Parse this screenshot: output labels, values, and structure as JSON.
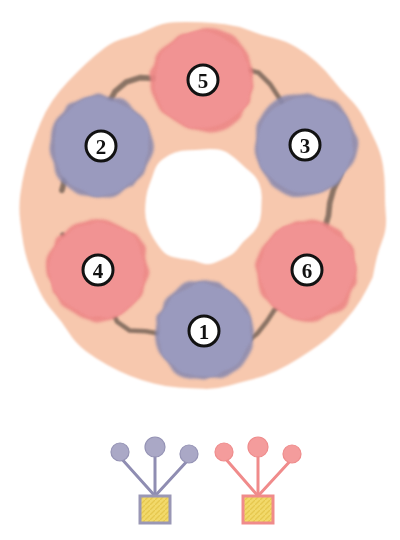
{
  "figure": {
    "background_color": "#ffffff",
    "ring": {
      "name": "outer-ring",
      "fill_color": "#F7C8AE",
      "edge_color": "#F2BCA0",
      "center_x": 202,
      "center_y": 205,
      "outer_radius": 183,
      "inner_hole_radius": 58,
      "inner_hole_color": "#ffffff",
      "septum_color": "#6B5B50",
      "septum_width": 5
    },
    "lobes": [
      {
        "label": "1",
        "type": "purple",
        "color": "#9A9ABE",
        "edge_color": "#8A8AAF",
        "cx": 204,
        "cy": 331,
        "r": 48
      },
      {
        "label": "2",
        "type": "purple",
        "color": "#9A9ABE",
        "edge_color": "#8A8AAF",
        "cx": 101,
        "cy": 146,
        "r": 50
      },
      {
        "label": "3",
        "type": "purple",
        "color": "#9A9ABE",
        "edge_color": "#8A8AAF",
        "cx": 305,
        "cy": 145,
        "r": 50
      },
      {
        "label": "4",
        "type": "salmon",
        "color": "#F19393",
        "edge_color": "#EC8585",
        "cx": 98,
        "cy": 270,
        "r": 49
      },
      {
        "label": "5",
        "type": "salmon",
        "color": "#F19393",
        "edge_color": "#EC8585",
        "cx": 203,
        "cy": 80,
        "r": 50
      },
      {
        "label": "6",
        "type": "salmon",
        "color": "#F19393",
        "edge_color": "#EC8585",
        "cx": 307,
        "cy": 270,
        "r": 49
      }
    ],
    "badge": {
      "name": "lobe-number-badge",
      "fill_color": "#ffffff",
      "ring_color": "#121212",
      "ring_width": 3,
      "radius": 15
    },
    "legend": {
      "name": "legend",
      "symbols": [
        {
          "id": "purple-symbol",
          "type": "purple",
          "circle_color": "#AAA8C6",
          "circle_edge_color": "#9593B5",
          "stalk_color": "#8F8DB2",
          "box_fill_color": "#F2D96A",
          "box_edge_color": "#9A97B5",
          "box_x": 140,
          "box_y": 496,
          "box_w": 30,
          "box_h": 27,
          "apex_x": 155,
          "apex_y": 496,
          "circles": [
            {
              "cx": 120,
              "cy": 452,
              "r": 9
            },
            {
              "cx": 155,
              "cy": 447,
              "r": 10
            },
            {
              "cx": 189,
              "cy": 454,
              "r": 9
            }
          ]
        },
        {
          "id": "salmon-symbol",
          "type": "salmon",
          "circle_color": "#F49C9C",
          "circle_edge_color": "#EF8C8C",
          "stalk_color": "#F08B8B",
          "box_fill_color": "#F2D96A",
          "box_edge_color": "#F08B8B",
          "box_x": 243,
          "box_y": 496,
          "box_w": 30,
          "box_h": 27,
          "apex_x": 258,
          "apex_y": 496,
          "circles": [
            {
              "cx": 224,
              "cy": 452,
              "r": 9
            },
            {
              "cx": 258,
              "cy": 447,
              "r": 10
            },
            {
              "cx": 292,
              "cy": 454,
              "r": 9
            }
          ]
        }
      ]
    }
  }
}
